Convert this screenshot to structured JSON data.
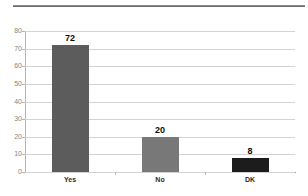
{
  "chart_data": {
    "type": "bar",
    "title": "",
    "subtitle": "",
    "xlabel": "",
    "ylabel": "",
    "categories": [
      "Yes",
      "No",
      "DK"
    ],
    "values": [
      72,
      20,
      8
    ],
    "data_labels": [
      "72",
      "20",
      "8"
    ],
    "ylim": [
      0,
      80
    ],
    "ytick_values": [
      80,
      70,
      60,
      50,
      40,
      30,
      20,
      10,
      0
    ],
    "ytick_labels": [
      "80",
      "70",
      "60",
      "50",
      "40",
      "30",
      "20",
      "10",
      "0"
    ],
    "grid": true,
    "grid_axis": "y",
    "legend": false,
    "legend_position": "none",
    "bar_colors": [
      "#5c5c5c",
      "#787878",
      "#1c1c1c"
    ],
    "series": [
      {
        "name": "Responses",
        "values": [
          72,
          20,
          8
        ]
      }
    ]
  },
  "colors": {
    "background": "#ffffff",
    "gridline": "#d3d3d3",
    "axis_line": "#b4b4b4",
    "baseline": "#9a9a9a",
    "top_rule": "#6e6e6e",
    "tick_label": "#848484",
    "category_label": "#2b2b2b",
    "value_label": "#0d0d0d"
  },
  "decorations": {
    "top_rule_name": "horizontal-divider-rule"
  }
}
